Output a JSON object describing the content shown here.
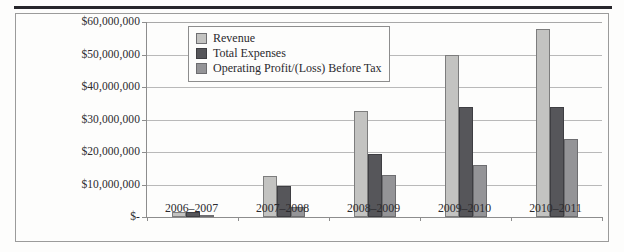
{
  "figure": {
    "name": "financial-performance-bar-chart",
    "has_top_rule": true,
    "has_frame": true
  },
  "legend": {
    "position": "top-left-inside",
    "entries": [
      {
        "label": "Revenue",
        "color": "#c3c3c1",
        "swatch_name": "legend-swatch-revenue"
      },
      {
        "label": "Total Expenses",
        "color": "#56565a",
        "swatch_name": "legend-swatch-total-expenses"
      },
      {
        "label": "Operating Profit/(Loss) Before Tax",
        "color": "#949497",
        "swatch_name": "legend-swatch-operating-profit"
      }
    ]
  },
  "axes": {
    "y_ticks": [
      {
        "label": "$60,000,000",
        "value": 60000000
      },
      {
        "label": "$50,000,000",
        "value": 50000000
      },
      {
        "label": "$40,000,000",
        "value": 40000000
      },
      {
        "label": "$30,000,000",
        "value": 30000000
      },
      {
        "label": "$20,000,000",
        "value": 20000000
      },
      {
        "label": "$10,000,000",
        "value": 10000000
      },
      {
        "label": "$-",
        "value": 0
      }
    ],
    "x_ticks": [
      "2006–2007",
      "2007–2008",
      "2008–2009",
      "2009–2010",
      "2010–2011"
    ]
  },
  "chart_data": {
    "type": "bar",
    "title": "",
    "subtitle": "",
    "xlabel": "",
    "ylabel": "",
    "ylim": [
      0,
      60000000
    ],
    "ytick_values": [
      0,
      10000000,
      20000000,
      30000000,
      40000000,
      50000000,
      60000000
    ],
    "ytick_labels": [
      "$-",
      "$10,000,000",
      "$20,000,000",
      "$30,000,000",
      "$40,000,000",
      "$50,000,000",
      "$60,000,000"
    ],
    "grid": true,
    "grid_axis": "y",
    "legend_position": "upper left",
    "categories": [
      "2006–2007",
      "2007–2008",
      "2008–2009",
      "2009–2010",
      "2010–2011"
    ],
    "series": [
      {
        "name": "Revenue",
        "color": "#c3c3c1",
        "values": [
          1600000,
          12500000,
          32500000,
          50000000,
          58000000
        ]
      },
      {
        "name": "Total Expenses",
        "color": "#56565a",
        "values": [
          1500000,
          9500000,
          19500000,
          34000000,
          34000000
        ]
      },
      {
        "name": "Operating Profit/(Loss) Before Tax",
        "color": "#949497",
        "values": [
          100000,
          3000000,
          13000000,
          16000000,
          24000000
        ]
      }
    ]
  }
}
